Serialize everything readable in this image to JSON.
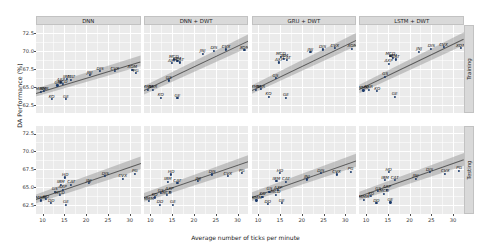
{
  "chart_data": {
    "type": "scatter",
    "title": "",
    "xlabel": "Average number of ticks per minute",
    "ylabel": "DA Performance (%)",
    "xlim": [
      8.5,
      32.5
    ],
    "ylim": [
      61.3,
      73.6
    ],
    "xticks": [
      10,
      15,
      20,
      25,
      30
    ],
    "yticks": [
      62.5,
      65.0,
      67.5,
      70.0,
      72.5
    ],
    "grid": true,
    "legend": "none",
    "facet_cols": [
      "DNN",
      "DNN + DWT",
      "GRU + DWT",
      "LSTM + DWT"
    ],
    "facet_rows": [
      "Training",
      "Testing"
    ],
    "point_color": "#1b3a6b",
    "band_color": "#9e9e9e",
    "line_color": "#5a5a5a",
    "panel_bg": "#ebebeb",
    "strip_bg": "#d9d9d9",
    "panels": [
      {
        "col": "DNN",
        "row": "Training",
        "fit": {
          "x0": 8.5,
          "y0": 64.2,
          "x1": 32.5,
          "y1": 68.6
        },
        "band": {
          "half0": 0.55,
          "half1": 0.75
        },
        "points": [
          {
            "label": "MMM",
            "x": 9.6,
            "y": 64.3
          },
          {
            "label": "NSR",
            "x": 10.4,
            "y": 64.4
          },
          {
            "label": "KO",
            "x": 12.1,
            "y": 63.3
          },
          {
            "label": "GE",
            "x": 15.4,
            "y": 63.3
          },
          {
            "label": "GS",
            "x": 13.4,
            "y": 65.2
          },
          {
            "label": "AXP",
            "x": 14.2,
            "y": 65.6
          },
          {
            "label": "MCD",
            "x": 14.6,
            "y": 65.4
          },
          {
            "label": "IBM",
            "x": 15.6,
            "y": 66.1
          },
          {
            "label": "CAT",
            "x": 16.6,
            "y": 66.0
          },
          {
            "label": "JNJ",
            "x": 20.8,
            "y": 66.6
          },
          {
            "label": "DIS",
            "x": 23.2,
            "y": 67.2
          },
          {
            "label": "CVX",
            "x": 26.6,
            "y": 67.2
          },
          {
            "label": "XOM",
            "x": 30.6,
            "y": 67.4
          },
          {
            "label": "PG",
            "x": 31.4,
            "y": 66.9
          }
        ]
      },
      {
        "col": "DNN + DWT",
        "row": "Training",
        "fit": {
          "x0": 8.5,
          "y0": 64.5,
          "x1": 32.5,
          "y1": 71.4
        },
        "band": {
          "half0": 0.6,
          "half1": 0.9
        },
        "points": [
          {
            "label": "MMM",
            "x": 9.4,
            "y": 64.6
          },
          {
            "label": "NSR",
            "x": 10.6,
            "y": 64.6
          },
          {
            "label": "KO",
            "x": 12.4,
            "y": 63.5
          },
          {
            "label": "GE",
            "x": 16.2,
            "y": 63.4
          },
          {
            "label": "GS",
            "x": 14.2,
            "y": 65.9
          },
          {
            "label": "AXP",
            "x": 15.0,
            "y": 68.3
          },
          {
            "label": "MCD",
            "x": 15.4,
            "y": 68.8
          },
          {
            "label": "IBM",
            "x": 16.2,
            "y": 68.6
          },
          {
            "label": "CAT",
            "x": 16.8,
            "y": 68.4
          },
          {
            "label": "JNJ",
            "x": 22.0,
            "y": 69.6
          },
          {
            "label": "DIS",
            "x": 24.6,
            "y": 70.0
          },
          {
            "label": "CVX",
            "x": 27.4,
            "y": 70.2
          },
          {
            "label": "XOM",
            "x": 31.6,
            "y": 70.1
          }
        ]
      },
      {
        "col": "GRU + DWT",
        "row": "Training",
        "fit": {
          "x0": 8.5,
          "y0": 64.6,
          "x1": 32.5,
          "y1": 71.6
        },
        "band": {
          "half0": 0.6,
          "half1": 0.9
        },
        "points": [
          {
            "label": "MMM",
            "x": 9.4,
            "y": 64.6
          },
          {
            "label": "NSR",
            "x": 10.6,
            "y": 64.7
          },
          {
            "label": "KO",
            "x": 12.4,
            "y": 63.6
          },
          {
            "label": "GE",
            "x": 16.4,
            "y": 63.5
          },
          {
            "label": "GS",
            "x": 14.0,
            "y": 66.2
          },
          {
            "label": "AXP",
            "x": 14.8,
            "y": 68.4
          },
          {
            "label": "MCD",
            "x": 15.2,
            "y": 69.2
          },
          {
            "label": "IBM",
            "x": 16.0,
            "y": 68.9
          },
          {
            "label": "CAT",
            "x": 16.6,
            "y": 68.7
          },
          {
            "label": "JNJ",
            "x": 22.0,
            "y": 69.8
          },
          {
            "label": "DIS",
            "x": 24.8,
            "y": 70.2
          },
          {
            "label": "CVX",
            "x": 27.6,
            "y": 70.4
          },
          {
            "label": "XOM",
            "x": 31.6,
            "y": 70.3
          }
        ]
      },
      {
        "col": "LSTM + DWT",
        "row": "Training",
        "fit": {
          "x0": 8.5,
          "y0": 64.7,
          "x1": 32.5,
          "y1": 71.7
        },
        "band": {
          "half0": 0.6,
          "half1": 0.9
        },
        "points": [
          {
            "label": "MMM",
            "x": 9.4,
            "y": 64.5
          },
          {
            "label": "NSR",
            "x": 10.6,
            "y": 64.6
          },
          {
            "label": "KO",
            "x": 12.6,
            "y": 64.4
          },
          {
            "label": "GE",
            "x": 16.6,
            "y": 63.6
          },
          {
            "label": "GS",
            "x": 14.4,
            "y": 66.4
          },
          {
            "label": "AXP",
            "x": 15.2,
            "y": 68.2
          },
          {
            "label": "MCD",
            "x": 15.6,
            "y": 69.3
          },
          {
            "label": "IBM",
            "x": 16.2,
            "y": 69.0
          },
          {
            "label": "CAT",
            "x": 16.8,
            "y": 68.8
          },
          {
            "label": "JNJ",
            "x": 22.2,
            "y": 69.9
          },
          {
            "label": "DIS",
            "x": 25.0,
            "y": 70.3
          },
          {
            "label": "CVX",
            "x": 27.8,
            "y": 70.5
          },
          {
            "label": "XOM",
            "x": 31.8,
            "y": 70.4
          }
        ]
      },
      {
        "col": "DNN",
        "row": "Testing",
        "fit": {
          "x0": 8.5,
          "y0": 63.4,
          "x1": 32.5,
          "y1": 68.4
        },
        "band": {
          "half0": 0.6,
          "half1": 0.9
        },
        "points": [
          {
            "label": "MMM",
            "x": 9.6,
            "y": 63.2
          },
          {
            "label": "DD",
            "x": 12.0,
            "y": 62.8
          },
          {
            "label": "GE",
            "x": 15.4,
            "y": 62.6
          },
          {
            "label": "KO",
            "x": 10.8,
            "y": 63.4
          },
          {
            "label": "GS",
            "x": 12.8,
            "y": 64.4
          },
          {
            "label": "AXP",
            "x": 14.6,
            "y": 64.7
          },
          {
            "label": "MCD",
            "x": 14.0,
            "y": 63.9
          },
          {
            "label": "IBM",
            "x": 14.2,
            "y": 65.4
          },
          {
            "label": "CAT",
            "x": 16.6,
            "y": 65.4
          },
          {
            "label": "HD",
            "x": 15.2,
            "y": 66.4
          },
          {
            "label": "JNJ",
            "x": 20.6,
            "y": 65.6
          },
          {
            "label": "DIS",
            "x": 24.4,
            "y": 66.6
          },
          {
            "label": "CVX",
            "x": 28.4,
            "y": 66.2
          },
          {
            "label": "PG",
            "x": 31.2,
            "y": 66.9
          }
        ]
      },
      {
        "col": "DNN + DWT",
        "row": "Testing",
        "fit": {
          "x0": 8.5,
          "y0": 63.6,
          "x1": 32.5,
          "y1": 68.6
        },
        "band": {
          "half0": 0.6,
          "half1": 0.9
        },
        "points": [
          {
            "label": "MMM",
            "x": 9.6,
            "y": 63.1
          },
          {
            "label": "DD",
            "x": 12.2,
            "y": 62.6
          },
          {
            "label": "GE",
            "x": 15.2,
            "y": 62.6
          },
          {
            "label": "KO",
            "x": 11.0,
            "y": 63.6
          },
          {
            "label": "GS",
            "x": 12.4,
            "y": 64.2
          },
          {
            "label": "AXP",
            "x": 14.4,
            "y": 64.4
          },
          {
            "label": "MCD",
            "x": 13.8,
            "y": 63.9
          },
          {
            "label": "IBM",
            "x": 14.0,
            "y": 65.8
          },
          {
            "label": "CAT",
            "x": 16.2,
            "y": 65.6
          },
          {
            "label": "HD",
            "x": 14.8,
            "y": 66.8
          },
          {
            "label": "JNJ",
            "x": 21.0,
            "y": 65.9
          },
          {
            "label": "DIS",
            "x": 24.2,
            "y": 66.8
          },
          {
            "label": "CVX",
            "x": 27.8,
            "y": 66.6
          },
          {
            "label": "PG",
            "x": 31.0,
            "y": 67.0
          }
        ]
      },
      {
        "col": "GRU + DWT",
        "row": "Testing",
        "fit": {
          "x0": 8.5,
          "y0": 63.7,
          "x1": 32.5,
          "y1": 68.8
        },
        "band": {
          "half0": 0.6,
          "half1": 0.9
        },
        "points": [
          {
            "label": "MMM",
            "x": 9.6,
            "y": 63.2
          },
          {
            "label": "DD",
            "x": 12.2,
            "y": 62.7
          },
          {
            "label": "GE",
            "x": 15.4,
            "y": 62.8
          },
          {
            "label": "KO",
            "x": 11.0,
            "y": 63.7
          },
          {
            "label": "GS",
            "x": 12.6,
            "y": 64.4
          },
          {
            "label": "AXP",
            "x": 14.6,
            "y": 64.6
          },
          {
            "label": "MCD",
            "x": 14.0,
            "y": 64.0
          },
          {
            "label": "IBM",
            "x": 14.2,
            "y": 65.9
          },
          {
            "label": "CAT",
            "x": 16.4,
            "y": 65.8
          },
          {
            "label": "HD",
            "x": 15.0,
            "y": 67.0
          },
          {
            "label": "JNJ",
            "x": 21.2,
            "y": 66.1
          },
          {
            "label": "DIS",
            "x": 24.4,
            "y": 67.0
          },
          {
            "label": "CVX",
            "x": 28.0,
            "y": 66.8
          },
          {
            "label": "PG",
            "x": 31.2,
            "y": 67.2
          }
        ]
      },
      {
        "col": "LSTM + DWT",
        "row": "Testing",
        "fit": {
          "x0": 8.5,
          "y0": 63.8,
          "x1": 32.5,
          "y1": 68.9
        },
        "band": {
          "half0": 0.6,
          "half1": 0.9
        },
        "points": [
          {
            "label": "MMM",
            "x": 9.6,
            "y": 63.3
          },
          {
            "label": "DD",
            "x": 12.4,
            "y": 62.8
          },
          {
            "label": "GE",
            "x": 15.6,
            "y": 62.9
          },
          {
            "label": "KO",
            "x": 11.2,
            "y": 63.8
          },
          {
            "label": "GS",
            "x": 12.8,
            "y": 64.5
          },
          {
            "label": "AXP",
            "x": 14.8,
            "y": 64.7
          },
          {
            "label": "MCD",
            "x": 14.2,
            "y": 64.1
          },
          {
            "label": "IBM",
            "x": 14.4,
            "y": 66.0
          },
          {
            "label": "CAT",
            "x": 16.6,
            "y": 66.0
          },
          {
            "label": "HD",
            "x": 15.2,
            "y": 67.1
          },
          {
            "label": "JNJ",
            "x": 21.4,
            "y": 66.2
          },
          {
            "label": "DIS",
            "x": 24.6,
            "y": 67.1
          },
          {
            "label": "CVX",
            "x": 28.2,
            "y": 66.9
          },
          {
            "label": "PG",
            "x": 31.4,
            "y": 67.3
          }
        ]
      }
    ]
  }
}
